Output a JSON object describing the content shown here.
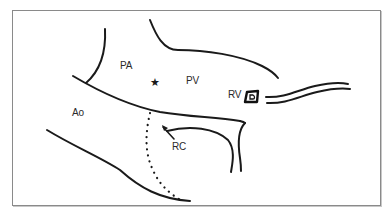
{
  "diagram": {
    "type": "anatomical-schematic",
    "labels": {
      "pa": "PA",
      "pv": "PV",
      "rv": "RV",
      "ao": "Ao",
      "rc": "RC"
    },
    "markers": {
      "star": "★",
      "rv_marker": "boxed-D symbol"
    },
    "colors": {
      "stroke": "#1a1a1a",
      "frame": "#8a8a8a",
      "text": "#2a2a2a",
      "background": "#ffffff"
    }
  }
}
